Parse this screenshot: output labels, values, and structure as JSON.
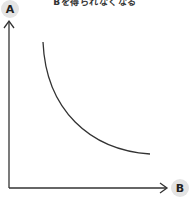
{
  "title": "Bを得られなくなる",
  "axes": {
    "y_label": "A",
    "x_label": "B"
  },
  "colors": {
    "line": "#333333",
    "badge_bg": "#e4e4e4",
    "text": "#222222"
  },
  "curve": {
    "description": "convex decreasing curve (trade-off between A and B)",
    "start": [
      43,
      42
    ],
    "end": [
      150,
      154
    ]
  }
}
